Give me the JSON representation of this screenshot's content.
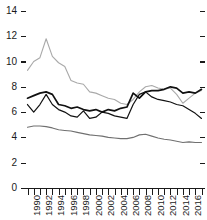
{
  "chart_data": {
    "type": "line",
    "title": "",
    "subtitle": "",
    "xlabel": "",
    "ylabel": "",
    "xlim": [
      1990,
      2018
    ],
    "ylim": [
      0,
      15
    ],
    "grid": false,
    "legend_position": "none",
    "y_ticks": [
      0,
      2,
      4,
      6,
      8,
      10,
      12,
      14
    ],
    "y_tick_labels": [
      "0",
      "2",
      "4",
      "6",
      "8",
      "10",
      "12",
      "14"
    ],
    "x_ticks": [
      1990,
      1992,
      1994,
      1996,
      1998,
      2000,
      2002,
      2004,
      2006,
      2008,
      2010,
      2012,
      2014,
      2016,
      2018
    ],
    "x_tick_labels": [
      "1990",
      "1992",
      "1994",
      "1996",
      "1998",
      "2000",
      "2002",
      "2004",
      "2006",
      "2008",
      "2010",
      "2012",
      "2014",
      "2016",
      "2018"
    ],
    "x_minor_ticks": [
      1990,
      1991,
      1992,
      1993,
      1994,
      1995,
      1996,
      1997,
      1998,
      1999,
      2000,
      2001,
      2002,
      2003,
      2004,
      2005,
      2006,
      2007,
      2008,
      2009,
      2010,
      2011,
      2012,
      2013,
      2014,
      2015,
      2016,
      2017,
      2018
    ],
    "x": [
      1990,
      1991,
      1992,
      1993,
      1994,
      1995,
      1996,
      1997,
      1998,
      1999,
      2000,
      2001,
      2002,
      2003,
      2004,
      2005,
      2006,
      2007,
      2008,
      2009,
      2010,
      2011,
      2012,
      2013,
      2014,
      2015,
      2016,
      2017,
      2018
    ],
    "series": [
      {
        "name": "series-light-gray-upper",
        "color": "#a9a9a9",
        "width": 1.1,
        "values": [
          9.3,
          10.0,
          10.3,
          11.8,
          10.4,
          9.9,
          9.6,
          8.5,
          8.3,
          8.2,
          7.6,
          7.5,
          7.3,
          7.1,
          7.0,
          6.7,
          6.6,
          7.0,
          7.6,
          8.0,
          8.1,
          7.9,
          7.8,
          7.9,
          7.4,
          6.7,
          7.1,
          7.5,
          7.7
        ]
      },
      {
        "name": "series-black-thick",
        "color": "#111111",
        "width": 1.7,
        "values": [
          7.1,
          7.3,
          7.5,
          7.6,
          7.4,
          6.6,
          6.5,
          6.3,
          6.4,
          6.2,
          6.1,
          6.2,
          6.0,
          6.2,
          6.1,
          6.3,
          6.4,
          7.5,
          7.1,
          7.6,
          7.7,
          7.7,
          7.8,
          8.0,
          7.9,
          7.5,
          7.6,
          7.5,
          7.8
        ]
      },
      {
        "name": "series-black-thin",
        "color": "#111111",
        "width": 1.2,
        "values": [
          6.6,
          6.0,
          6.6,
          7.4,
          6.6,
          6.2,
          6.0,
          5.7,
          5.6,
          6.1,
          5.5,
          5.6,
          6.0,
          5.9,
          5.7,
          5.6,
          5.5,
          6.6,
          7.4,
          7.6,
          7.2,
          7.0,
          6.9,
          6.8,
          6.6,
          6.5,
          6.2,
          5.9,
          5.5
        ]
      },
      {
        "name": "series-gray-lower",
        "color": "#707070",
        "width": 1.1,
        "values": [
          4.8,
          4.9,
          4.9,
          4.85,
          4.75,
          4.6,
          4.55,
          4.5,
          4.4,
          4.3,
          4.2,
          4.15,
          4.1,
          4.0,
          3.95,
          3.9,
          3.9,
          4.0,
          4.2,
          4.25,
          4.1,
          3.95,
          3.85,
          3.8,
          3.7,
          3.6,
          3.65,
          3.6,
          3.6
        ]
      }
    ]
  },
  "axes": {
    "axis_color": "#1a1a1a",
    "right_ticks_shown": true,
    "left_ticks_shown": true,
    "bottom_ticks_shown": true
  }
}
